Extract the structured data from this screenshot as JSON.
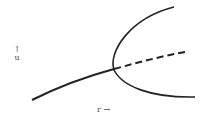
{
  "diagram": {
    "type": "pitchfork-bifurcation",
    "y_axis_label": "u",
    "y_axis_arrow": "↑",
    "x_axis_label": "r",
    "x_axis_arrow": "→",
    "branches": [
      {
        "name": "trivial-stable",
        "style": "solid"
      },
      {
        "name": "trivial-unstable",
        "style": "dashed"
      },
      {
        "name": "upper-stable",
        "style": "solid"
      },
      {
        "name": "lower-stable",
        "style": "solid"
      }
    ],
    "stroke_color": "#222222"
  }
}
